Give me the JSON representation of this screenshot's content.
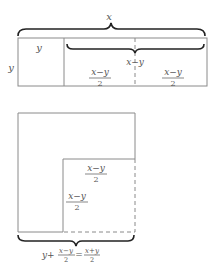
{
  "top_figure": {
    "outer_brace_label": "x",
    "inner_brace_label": "x−y",
    "side_label": "y",
    "left_cell_label": "y",
    "middle_cell": {
      "numerator": "x−y",
      "denominator": "2"
    },
    "right_cell": {
      "numerator": "x−y",
      "denominator": "2"
    }
  },
  "bottom_figure": {
    "inner_top_label": {
      "numerator": "x−y",
      "denominator": "2"
    },
    "inner_side_label": {
      "numerator": "x−y",
      "denominator": "2"
    },
    "bottom_formula": {
      "lhs_prefix": "y+",
      "lhs_fraction": {
        "numerator": "x−y",
        "denominator": "2"
      },
      "equals": "=",
      "rhs_fraction": {
        "numerator": "x+y",
        "denominator": "2"
      }
    }
  },
  "colors": {
    "edge": "#8a8a8a",
    "brace": "#222222",
    "text": "#555555"
  }
}
